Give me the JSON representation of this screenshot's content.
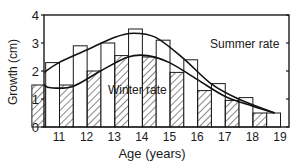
{
  "chart_data": {
    "type": "bar",
    "title": "",
    "xlabel": "Age (years)",
    "ylabel": "Growth (cm)",
    "ylim": [
      0,
      4
    ],
    "yticks": [
      0,
      1,
      2,
      3,
      4
    ],
    "xticks": [
      "11",
      "12",
      "13",
      "14",
      "15",
      "16",
      "17",
      "18",
      "19"
    ],
    "grid": false,
    "legend": "none (curves labeled inline)",
    "series": [
      {
        "name": "Winter rate",
        "style": "hatched bars",
        "values": [
          1.5,
          1.5,
          2.0,
          2.55,
          2.5,
          1.95,
          1.3,
          0.95,
          0.5
        ]
      },
      {
        "name": "Summer rate",
        "style": "white bars",
        "values": [
          2.3,
          2.9,
          3.0,
          3.5,
          3.1,
          2.4,
          1.55,
          1.05,
          0.5
        ]
      }
    ],
    "curves": [
      {
        "name": "Summer rate",
        "points": [
          [
            10.5,
            1.95
          ],
          [
            11.5,
            2.3
          ],
          [
            12.5,
            2.75
          ],
          [
            13.5,
            3.2
          ],
          [
            14.2,
            3.35
          ],
          [
            15,
            3.2
          ],
          [
            16,
            2.45
          ],
          [
            17,
            1.55
          ],
          [
            18,
            1.0
          ],
          [
            19.3,
            0.5
          ]
        ]
      },
      {
        "name": "Winter rate",
        "points": [
          [
            10.5,
            1.5
          ],
          [
            11.2,
            1.4
          ],
          [
            12,
            1.45
          ],
          [
            13,
            2.0
          ],
          [
            14,
            2.5
          ],
          [
            14.7,
            2.55
          ],
          [
            15.5,
            2.3
          ],
          [
            16.5,
            1.7
          ],
          [
            17.5,
            1.1
          ],
          [
            18.5,
            0.75
          ],
          [
            19.3,
            0.5
          ]
        ]
      }
    ],
    "annotations": [
      {
        "text": "Summer rate",
        "x": 15.6,
        "y": 3.0
      },
      {
        "text": "Winter rate",
        "x": 13.1,
        "y": 1.4
      }
    ]
  }
}
